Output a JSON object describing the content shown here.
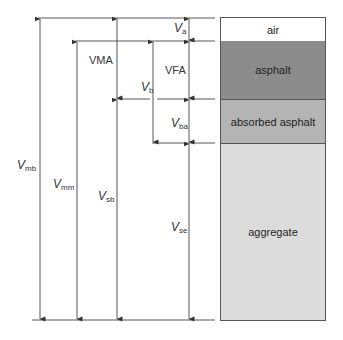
{
  "diagram": {
    "phases": [
      {
        "label": "air",
        "color": "#ffffff"
      },
      {
        "label": "asphalt",
        "color": "#8c8c8c"
      },
      {
        "label": "absorbed asphalt",
        "color": "#b4b4b4"
      },
      {
        "label": "aggregate",
        "color": "#dcdcdc"
      }
    ],
    "dimensions": {
      "va": {
        "symbol": "V",
        "sub": "a"
      },
      "vma": {
        "text": "VMA"
      },
      "vfa": {
        "text": "VFA"
      },
      "vb": {
        "symbol": "V",
        "sub": "b"
      },
      "vba": {
        "symbol": "V",
        "sub": "ba"
      },
      "vmb": {
        "symbol": "V",
        "sub": "mb"
      },
      "vmm": {
        "symbol": "V",
        "sub": "mm"
      },
      "vsb": {
        "symbol": "V",
        "sub": "sb"
      },
      "vse": {
        "symbol": "V",
        "sub": "se"
      }
    }
  }
}
